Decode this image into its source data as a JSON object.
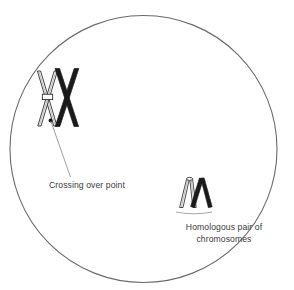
{
  "figure": {
    "type": "biology-diagram",
    "width": 294,
    "height": 290,
    "background_color": "#ffffff",
    "stroke_color": "#555555",
    "text_color": "#3b3b3b",
    "fill_color": "#1a1a1a"
  },
  "cell": {
    "name": "cell-boundary",
    "shape": "circle",
    "center_x": 143,
    "center_y": 149,
    "radius": 134,
    "stroke_color": "#666666",
    "stroke_width": 1,
    "fill": "none"
  },
  "structures": {
    "tetrad": {
      "name": "crossing-over-chromosome-pair",
      "description": "Two X-shaped chromosomes overlapping at a chiasma",
      "chromatids": [
        {
          "label": "maternal-chromosome",
          "style": "outlined",
          "fill": "#ffffff",
          "stroke": "#222222"
        },
        {
          "label": "paternal-chromosome",
          "style": "solid",
          "fill": "#1a1a1a",
          "stroke": "#1a1a1a"
        }
      ],
      "centromere": {
        "label": "centromere-band",
        "style": "outlined"
      }
    },
    "homologous_pair": {
      "name": "homologous-pair-chromosomes",
      "description": "Two V-shaped chromosomes side by side forming an M",
      "chromatids": [
        {
          "label": "maternal-chromosome",
          "style": "outlined",
          "fill": "#ffffff",
          "stroke": "#222222"
        },
        {
          "label": "paternal-chromosome",
          "style": "solid",
          "fill": "#1a1a1a",
          "stroke": "#1a1a1a"
        }
      ]
    }
  },
  "labels": {
    "crossing_over": {
      "text": "Crossing over point",
      "align": "left",
      "leader": true
    },
    "homologous": {
      "line1": "Homologous pair of",
      "line2": "chromosomes",
      "align": "center",
      "leader": true
    }
  }
}
